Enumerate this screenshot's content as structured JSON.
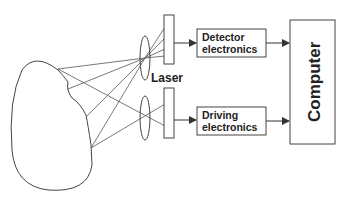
{
  "diagram": {
    "laser_label": "Laser",
    "detector_box": {
      "line1": "Detector",
      "line2": "electronics"
    },
    "driving_box": {
      "line1": "Driving",
      "line2": "electronics"
    },
    "computer_label": "Computer"
  },
  "colors": {
    "stroke": "#444444",
    "text": "#222222",
    "background": "#ffffff"
  }
}
